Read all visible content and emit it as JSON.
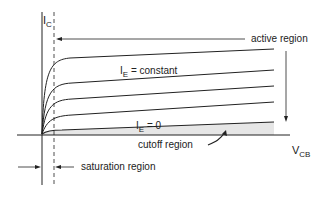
{
  "diagram": {
    "y_axis": {
      "symbol": "I",
      "subscript": "C"
    },
    "x_axis": {
      "symbol": "V",
      "subscript": "CB"
    },
    "labels": {
      "active_region": "active region",
      "ie_constant_symbol": "I",
      "ie_constant_sub": "E",
      "ie_constant_rest": " = constant",
      "ie_zero_symbol": "I",
      "ie_zero_sub": "E",
      "ie_zero_rest": " = 0",
      "cutoff_region": "cutoff region",
      "saturation_region": "saturation region"
    },
    "curves": [
      "I_E level 4",
      "I_E level 3",
      "I_E level 2",
      "I_E level 1",
      "I_E = 0"
    ],
    "colors": {
      "line": "#222222",
      "cutoff_shade": "#e6e6e6"
    }
  }
}
